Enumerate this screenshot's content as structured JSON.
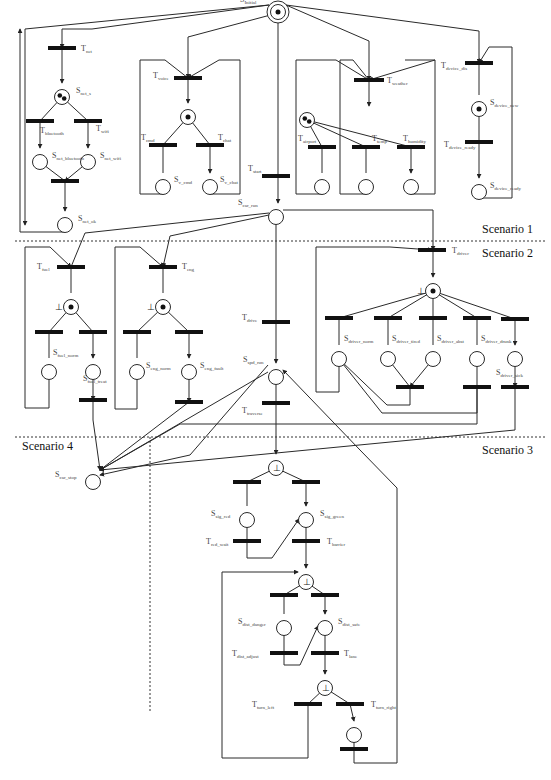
{
  "diagram": {
    "scenarios": [
      {
        "id": "s1",
        "label": "Scenario 1",
        "x": 482,
        "y": 233
      },
      {
        "id": "s2",
        "label": "Scenario 2",
        "x": 482,
        "y": 257
      },
      {
        "id": "s3",
        "label": "Scenario 3",
        "x": 482,
        "y": 454
      },
      {
        "id": "s4",
        "label": "Scenario 4",
        "x": 22,
        "y": 450
      }
    ],
    "dividers": [
      {
        "x1": 15,
        "y1": 241,
        "x2": 545,
        "y2": 241
      },
      {
        "x1": 15,
        "y1": 437,
        "x2": 545,
        "y2": 437
      },
      {
        "x1": 150,
        "y1": 437,
        "x2": 150,
        "y2": 712
      }
    ],
    "places": [
      {
        "id": "S_initial",
        "label": "S",
        "sub": "Initial",
        "x": 278,
        "y": 5,
        "double": true,
        "tokens": 1,
        "lx": 240,
        "ly": 2
      },
      {
        "id": "S_net_s",
        "label": "S",
        "sub": "net_s",
        "x": 62,
        "y": 90,
        "tokens": 2,
        "lx": 76,
        "ly": 93
      },
      {
        "id": "S_net_bluetooth",
        "label": "S",
        "sub": "net_bluetooth",
        "x": 40,
        "y": 155,
        "lx": 52,
        "ly": 158
      },
      {
        "id": "S_net_wifi",
        "label": "S",
        "sub": "net_wifi",
        "x": 88,
        "y": 155,
        "lx": 100,
        "ly": 158
      },
      {
        "id": "S_net_ok",
        "label": "S",
        "sub": "net_ok",
        "x": 65,
        "y": 218,
        "lx": 78,
        "ly": 221
      },
      {
        "id": "S_voice_ready",
        "label": "",
        "sub": "",
        "x": 188,
        "y": 110,
        "tokens": 1
      },
      {
        "id": "S_v_cmd",
        "label": "S",
        "sub": "v_cmd",
        "x": 163,
        "y": 180,
        "lx": 174,
        "ly": 182
      },
      {
        "id": "S_v_chat",
        "label": "S",
        "sub": "v_chat",
        "x": 210,
        "y": 180,
        "lx": 220,
        "ly": 182
      },
      {
        "id": "S_weather",
        "label": "",
        "sub": "",
        "x": 307,
        "y": 113,
        "tokens": 2
      },
      {
        "id": "S_wx_1",
        "label": "",
        "sub": "",
        "x": 322,
        "y": 180
      },
      {
        "id": "S_wx_2",
        "label": "",
        "sub": "",
        "x": 366,
        "y": 180
      },
      {
        "id": "S_wx_3",
        "label": "",
        "sub": "",
        "x": 411,
        "y": 180
      },
      {
        "id": "S_device_new",
        "label": "S",
        "sub": "device_new",
        "x": 479,
        "y": 102,
        "tokens": 1,
        "lx": 490,
        "ly": 105
      },
      {
        "id": "S_device_ready",
        "label": "S",
        "sub": "device_ready",
        "x": 479,
        "y": 185,
        "lx": 490,
        "ly": 188
      },
      {
        "id": "S_car_run",
        "label": "S",
        "sub": "car_run",
        "x": 276,
        "y": 210,
        "lx": 238,
        "ly": 205
      },
      {
        "id": "S_fuel_ready",
        "label": "",
        "sub": "",
        "x": 71,
        "y": 300,
        "tokens": 1,
        "bottom": true
      },
      {
        "id": "S_fuel_norm",
        "label": "S",
        "sub": "fuel_norm",
        "x": 49,
        "y": 365,
        "lx": 53,
        "ly": 355
      },
      {
        "id": "S_fuel_treat",
        "label": "S",
        "sub": "fuel_treat",
        "x": 93,
        "y": 365,
        "lx": 83,
        "ly": 381
      },
      {
        "id": "S_eng_ready",
        "label": "",
        "sub": "",
        "x": 163,
        "y": 300,
        "tokens": 1,
        "bottom": true
      },
      {
        "id": "S_eng_norm",
        "label": "S",
        "sub": "eng_norm",
        "x": 137,
        "y": 365,
        "lx": 146,
        "ly": 368
      },
      {
        "id": "S_eng_fault",
        "label": "S",
        "sub": "eng_fault",
        "x": 189,
        "y": 365,
        "lx": 200,
        "ly": 368
      },
      {
        "id": "S_driver_ready",
        "label": "",
        "sub": "",
        "x": 433,
        "y": 284,
        "tokens": 1,
        "bottom": true
      },
      {
        "id": "S_driver_norm",
        "label": "S",
        "sub": "driver_norm",
        "x": 339,
        "y": 352,
        "lx": 344,
        "ly": 341
      },
      {
        "id": "S_driver_tired",
        "label": "S",
        "sub": "driver_tired",
        "x": 388,
        "y": 352,
        "lx": 392,
        "ly": 341
      },
      {
        "id": "S_driver_abst",
        "label": "S",
        "sub": "driver_abst",
        "x": 433,
        "y": 352,
        "lx": 437,
        "ly": 341
      },
      {
        "id": "S_driver_drunk",
        "label": "S",
        "sub": "driver_drunk",
        "x": 477,
        "y": 352,
        "lx": 481,
        "ly": 341
      },
      {
        "id": "S_driver_sick",
        "label": "S",
        "sub": "driver_sick",
        "x": 515,
        "y": 352,
        "lx": 496,
        "ly": 375
      },
      {
        "id": "S_spd_run",
        "label": "S",
        "sub": "spd_run",
        "x": 276,
        "y": 370,
        "lx": 243,
        "ly": 362
      },
      {
        "id": "S_car_stop",
        "label": "S",
        "sub": "car_stop",
        "x": 93,
        "y": 475,
        "lx": 55,
        "ly": 477
      },
      {
        "id": "S_sig_check",
        "label": "",
        "sub": "",
        "x": 276,
        "y": 461,
        "bottom": true
      },
      {
        "id": "S_sig_red",
        "label": "S",
        "sub": "sig_red",
        "x": 247,
        "y": 513,
        "lx": 211,
        "ly": 516
      },
      {
        "id": "S_sig_green",
        "label": "S",
        "sub": "sig_green",
        "x": 306,
        "y": 513,
        "lx": 320,
        "ly": 516
      },
      {
        "id": "S_dist_check",
        "label": "",
        "sub": "",
        "x": 306,
        "y": 575,
        "bottom": true
      },
      {
        "id": "S_dist_danger",
        "label": "S",
        "sub": "dist_danger",
        "x": 284,
        "y": 621,
        "lx": 238,
        "ly": 624
      },
      {
        "id": "S_dist_safe",
        "label": "S",
        "sub": "dist_safe",
        "x": 325,
        "y": 621,
        "lx": 338,
        "ly": 624
      },
      {
        "id": "S_turn_check",
        "label": "",
        "sub": "",
        "x": 325,
        "y": 681,
        "bottom": true
      },
      {
        "id": "S_turn_right",
        "label": "",
        "sub": "",
        "x": 354,
        "y": 728
      }
    ],
    "transitions": [
      {
        "id": "T_net",
        "label": "T",
        "sub": "net",
        "x": 62,
        "y": 48,
        "w": 28,
        "lx": 81,
        "ly": 51
      },
      {
        "id": "T_bluetooth",
        "label": "T",
        "sub": "bluetooth",
        "x": 40,
        "y": 121,
        "w": 28,
        "lx": 40,
        "ly": 133
      },
      {
        "id": "T_wifi",
        "label": "T",
        "sub": "wifi",
        "x": 88,
        "y": 121,
        "w": 0,
        "lx": 96,
        "ly": 131
      },
      {
        "id": "T_net_join",
        "label": "",
        "sub": "",
        "x": 65,
        "y": 181,
        "w": 28
      },
      {
        "id": "T_voice",
        "label": "T",
        "sub": "voice",
        "x": 188,
        "y": 78,
        "w": 28,
        "lx": 153,
        "ly": 78
      },
      {
        "id": "T_cmd",
        "label": "T",
        "sub": "cmd",
        "x": 163,
        "y": 145,
        "w": 28,
        "lx": 141,
        "ly": 140
      },
      {
        "id": "T_chat",
        "label": "T",
        "sub": "chat",
        "x": 210,
        "y": 145,
        "w": 28,
        "lx": 218,
        "ly": 140
      },
      {
        "id": "T_weather",
        "label": "T",
        "sub": "weather",
        "x": 369,
        "y": 80,
        "w": 30,
        "lx": 387,
        "ly": 83
      },
      {
        "id": "T_airport",
        "label": "T",
        "sub": "airport",
        "x": 322,
        "y": 147,
        "w": 28,
        "lx": 298,
        "ly": 141
      },
      {
        "id": "T_temp",
        "label": "T",
        "sub": "temp",
        "x": 366,
        "y": 147,
        "w": 28,
        "lx": 372,
        "ly": 141
      },
      {
        "id": "T_humidity",
        "label": "T",
        "sub": "humidity",
        "x": 411,
        "y": 147,
        "w": 28,
        "lx": 403,
        "ly": 141
      },
      {
        "id": "T_device_dis",
        "label": "T",
        "sub": "device_dis",
        "x": 479,
        "y": 63,
        "w": 28,
        "lx": 441,
        "ly": 68
      },
      {
        "id": "T_device_ready",
        "label": "T",
        "sub": "device_ready",
        "x": 479,
        "y": 142,
        "w": 28,
        "lx": 444,
        "ly": 147
      },
      {
        "id": "T_start",
        "label": "T",
        "sub": "start",
        "x": 276,
        "y": 176,
        "w": 28,
        "lx": 248,
        "ly": 171
      },
      {
        "id": "T_fuel",
        "label": "T",
        "sub": "fuel",
        "x": 71,
        "y": 267,
        "w": 28,
        "lx": 37,
        "ly": 269
      },
      {
        "id": "T_fuel_a",
        "label": "",
        "sub": "",
        "x": 49,
        "y": 332,
        "w": 28
      },
      {
        "id": "T_fuel_b",
        "label": "",
        "sub": "",
        "x": 93,
        "y": 332,
        "w": 28
      },
      {
        "id": "T_fuel_out",
        "label": "",
        "sub": "",
        "x": 93,
        "y": 400,
        "w": 28
      },
      {
        "id": "T_eng",
        "label": "T",
        "sub": "eng",
        "x": 163,
        "y": 267,
        "w": 28,
        "lx": 182,
        "ly": 269
      },
      {
        "id": "T_eng_a",
        "label": "",
        "sub": "",
        "x": 137,
        "y": 332,
        "w": 28
      },
      {
        "id": "T_eng_b",
        "label": "",
        "sub": "",
        "x": 189,
        "y": 332,
        "w": 28
      },
      {
        "id": "T_eng_out",
        "label": "",
        "sub": "",
        "x": 189,
        "y": 402,
        "w": 28
      },
      {
        "id": "T_driver",
        "label": "T",
        "sub": "driver",
        "x": 432,
        "y": 250,
        "w": 28,
        "lx": 452,
        "ly": 253
      },
      {
        "id": "T_drv_1",
        "label": "",
        "sub": "",
        "x": 339,
        "y": 318,
        "w": 28
      },
      {
        "id": "T_drv_2",
        "label": "",
        "sub": "",
        "x": 388,
        "y": 318,
        "w": 28
      },
      {
        "id": "T_drv_3",
        "label": "",
        "sub": "",
        "x": 433,
        "y": 318,
        "w": 28
      },
      {
        "id": "T_drv_4",
        "label": "",
        "sub": "",
        "x": 477,
        "y": 318,
        "w": 28
      },
      {
        "id": "T_drv_5",
        "label": "",
        "sub": "",
        "x": 515,
        "y": 319,
        "w": 28
      },
      {
        "id": "T_drv_join",
        "label": "",
        "sub": "",
        "x": 410,
        "y": 387,
        "w": 28
      },
      {
        "id": "T_drv_drunk_out",
        "label": "",
        "sub": "",
        "x": 477,
        "y": 387,
        "w": 28
      },
      {
        "id": "T_drv_sick_out",
        "label": "",
        "sub": "",
        "x": 515,
        "y": 387,
        "w": 28
      },
      {
        "id": "T_drive",
        "label": "T",
        "sub": "drive",
        "x": 276,
        "y": 322,
        "w": 28,
        "lx": 242,
        "ly": 320
      },
      {
        "id": "T_traverse",
        "label": "T",
        "sub": "traverse",
        "x": 276,
        "y": 403,
        "w": 28,
        "lx": 242,
        "ly": 413
      },
      {
        "id": "T_sig_a",
        "label": "",
        "sub": "",
        "x": 247,
        "y": 482,
        "w": 28
      },
      {
        "id": "T_sig_b",
        "label": "",
        "sub": "",
        "x": 306,
        "y": 482,
        "w": 28
      },
      {
        "id": "T_red_wait",
        "label": "T",
        "sub": "red_wait",
        "x": 247,
        "y": 541,
        "w": 28,
        "lx": 206,
        "ly": 544
      },
      {
        "id": "T_barrier",
        "label": "T",
        "sub": "barrier",
        "x": 306,
        "y": 541,
        "w": 28,
        "lx": 327,
        "ly": 544
      },
      {
        "id": "T_dist_a",
        "label": "",
        "sub": "",
        "x": 284,
        "y": 595,
        "w": 28
      },
      {
        "id": "T_dist_b",
        "label": "",
        "sub": "",
        "x": 325,
        "y": 595,
        "w": 28
      },
      {
        "id": "T_dist_adjust",
        "label": "T",
        "sub": "dist_adjust",
        "x": 284,
        "y": 653,
        "w": 28,
        "lx": 232,
        "ly": 656
      },
      {
        "id": "T_lane",
        "label": "T",
        "sub": "lane",
        "x": 325,
        "y": 653,
        "w": 28,
        "lx": 344,
        "ly": 656
      },
      {
        "id": "T_turn_left",
        "label": "T",
        "sub": "turn_left",
        "x": 308,
        "y": 704,
        "w": 28,
        "lx": 252,
        "ly": 707
      },
      {
        "id": "T_turn_right",
        "label": "T",
        "sub": "turn_right",
        "x": 350,
        "y": 704,
        "w": 28,
        "lx": 371,
        "ly": 707
      },
      {
        "id": "T_turn_right_out",
        "label": "",
        "sub": "",
        "x": 354,
        "y": 749,
        "w": 28
      }
    ],
    "arcs": [
      "M269,5 L92,29 L62,29 L62,48",
      "M269,5 L25,29 L25,225",
      "M62,48 L62,83",
      "M62,97 L40,121 L40,148",
      "M62,97 L88,121 L88,148",
      "M40,162 L65,181 M88,162 L65,181",
      "M65,181 L65,211",
      "M65,225 L65,232 L20,232 L20,29",
      "M278,13 L188,37 L188,78",
      "M188,78 L188,103",
      "M188,117 L163,145 L163,173 M188,117 L210,145 L210,173",
      "M140,60 L165,60 L188,78 M240,60 L219,60 L188,78",
      "M140,60 L140,90 L140,194 L163,194 L163,187",
      "M240,60 L240,194 L210,194 L210,187",
      "M286,5 L369,41 L369,80",
      "M369,80 L369,106",
      "M307,120 L322,147 L322,173 M307,120 L366,147 L366,173 M307,120 L411,147 L411,173",
      "M296,60 L336,60 L369,80 M340,60 L353,60 L369,80 M405,60 L435,60 L369,80",
      "M296,60 L296,194 L322,194 L322,187 M340,60 L340,194 L366,194 L366,187 M435,60 L435,194 L411,194 L411,187",
      "M286,5 L479,31 L479,63",
      "M479,63 L479,95 M479,109 L479,142 L479,178",
      "M479,192 L479,198 L512,198 L512,47 L489,47 L479,63",
      "M278,13 L278,176 L278,203",
      "M283,210 L433,210 L433,250",
      "M269,213 L85,233 L71,267 M269,215 L170,236 L163,267",
      "M71,267 L71,293 M71,307 L49,332 L49,358 M71,307 L93,332 L93,358",
      "M93,372 L93,400",
      "M49,372 L49,408 L25,408 L25,247 L50,247 L71,267",
      "M163,267 L163,293 M163,307 L137,332 L137,358 M163,307 L189,332 L189,358",
      "M189,372 L189,402",
      "M137,372 L137,409 L115,409 L115,247 L140,247 L163,267",
      "M433,250 L433,277",
      "M433,291 L339,318 L339,345 M433,291 L388,318 L388,345 M433,291 L433,318 L433,345 M433,291 L477,318 L477,345 M433,291 L515,319 L515,345",
      "M388,359 L410,387 M433,359 L410,387",
      "M477,359 L477,387 M515,359 L515,387",
      "M339,359 L339,392 L316,392 L316,247 L390,247 L432,250",
      "M410,387 L410,405 L387,405 L339,359",
      "M477,387 L477,413 L382,413 L339,359",
      "M276,217 L276,322 L276,363",
      "M276,377 L276,403 L276,454",
      "M268,372 L100,470",
      "M93,400 L93,420 L100,470",
      "M189,402 L100,470",
      "M515,387 L515,430 L100,470",
      "M477,387 L477,424 L180,424 L100,470",
      "M276,468 L247,482 L247,506 M276,468 L306,482 L306,506",
      "M247,520 L247,541 L247,558 L272,558 L299,519",
      "M306,520 L306,541 L306,568",
      "M306,582 L284,595 L284,614 M306,582 L325,595 L325,614",
      "M284,628 L284,653 L284,665 L300,665 L318,626",
      "M325,628 L325,653 L325,674",
      "M325,688 L308,704 M325,688 L350,704 L354,721",
      "M308,704 L308,758 L222,758 L222,572 L298,572",
      "M354,735 L354,749 L354,763 L397,763 L397,488 L360,450 L283,370",
      "M268,365 L190,455 L100,475"
    ]
  }
}
